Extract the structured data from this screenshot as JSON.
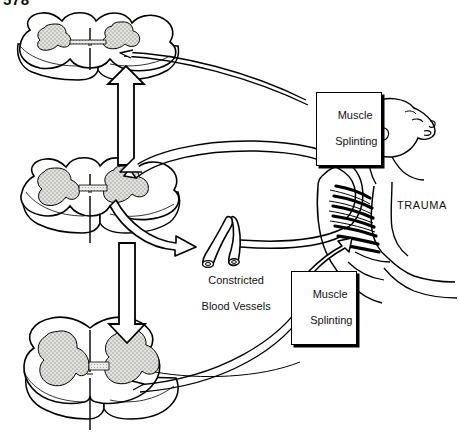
{
  "page": {
    "number": "578"
  },
  "diagram": {
    "type": "medical-illustration",
    "nodes": [
      {
        "id": "cord-top",
        "name": "spinal-cord-cross-section-top",
        "label": ""
      },
      {
        "id": "cord-middle",
        "name": "spinal-cord-cross-section-middle",
        "label": ""
      },
      {
        "id": "cord-bottom",
        "name": "spinal-cord-cross-section-bottom",
        "label": ""
      },
      {
        "id": "vessels",
        "name": "constricted-blood-vessels",
        "label": "Constricted\nBlood Vessels"
      },
      {
        "id": "patient",
        "name": "trauma-patient-figure",
        "label": "TRAUMA"
      },
      {
        "id": "splint-top",
        "name": "muscle-splinting-box-upper",
        "label": "Muscle\nSplinting"
      },
      {
        "id": "splint-bot",
        "name": "muscle-splinting-box-lower",
        "label": "Muscle\nSplinting"
      }
    ],
    "labels": {
      "muscle_splinting_upper_line1": "Muscle",
      "muscle_splinting_upper_line2": "Splinting",
      "muscle_splinting_lower_line1": "Muscle",
      "muscle_splinting_lower_line2": "Splinting",
      "constricted_line1": "Constricted",
      "constricted_line2": "Blood Vessels",
      "trauma": "TRAUMA"
    },
    "colors": {
      "ink": "#000000",
      "paper": "#ffffff",
      "gray_matter": "#d8d8d4",
      "stipple": "#9a9a96",
      "shadow": "#000000"
    }
  }
}
